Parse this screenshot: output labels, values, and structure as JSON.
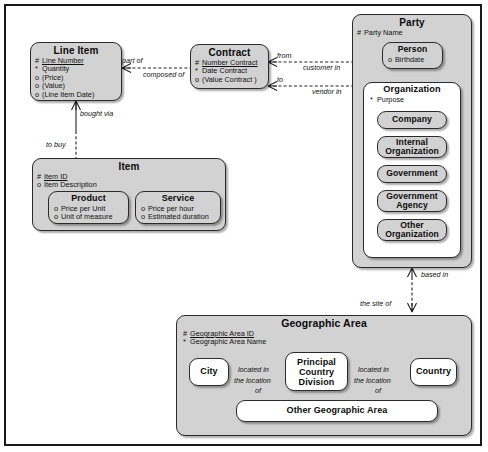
{
  "diagram": {
    "colors": {
      "entity_fill": "#d2d2d2",
      "leaf_fill": "#ffffff",
      "stroke": "#2b2b2b",
      "frame": "#1a1a1a"
    }
  },
  "entities": {
    "line_item": {
      "name": "Line Item",
      "attributes": [
        {
          "marker": "#",
          "label": "Line Number",
          "key": true
        },
        {
          "marker": "*",
          "label": "Quantity",
          "key": false
        },
        {
          "marker": "o",
          "label": "(Price)",
          "key": false
        },
        {
          "marker": "o",
          "label": "(Value)",
          "key": false
        },
        {
          "marker": "o",
          "label": "(Line Item Date)",
          "key": false
        }
      ]
    },
    "contract": {
      "name": "Contract",
      "attributes": [
        {
          "marker": "#",
          "label": "Number Contract",
          "key": true
        },
        {
          "marker": "*",
          "label": "Date Contract",
          "key": false
        },
        {
          "marker": "o",
          "label": "(Value Contract )",
          "key": false
        }
      ]
    },
    "party": {
      "name": "Party",
      "attributes": [
        {
          "marker": "#",
          "label": "Party Name",
          "key": false
        }
      ]
    },
    "person": {
      "name": "Person",
      "attributes": [
        {
          "marker": "o",
          "label": "Birthdate",
          "key": false
        }
      ]
    },
    "organization": {
      "name": "Organization",
      "attributes": [
        {
          "marker": "*",
          "label": "Purpose",
          "key": false
        }
      ],
      "subtypes": [
        {
          "name": "Company"
        },
        {
          "name": "Internal Organization"
        },
        {
          "name": "Government"
        },
        {
          "name": "Government Agency"
        },
        {
          "name": "Other Organization"
        }
      ]
    },
    "item": {
      "name": "Item",
      "attributes": [
        {
          "marker": "#",
          "label": "Item ID",
          "key": true
        },
        {
          "marker": "o",
          "label": "Item Description",
          "key": false
        }
      ]
    },
    "product": {
      "name": "Product",
      "attributes": [
        {
          "marker": "o",
          "label": "Price per Unit",
          "key": false
        },
        {
          "marker": "o",
          "label": "Unit of measure",
          "key": false
        }
      ]
    },
    "service": {
      "name": "Service",
      "attributes": [
        {
          "marker": "o",
          "label": "Price per hour",
          "key": false
        },
        {
          "marker": "o",
          "label": "Estimated duration",
          "key": false
        }
      ]
    },
    "geographic_area": {
      "name": "Geographic Area",
      "attributes": [
        {
          "marker": "#",
          "label": "Geographic Area ID",
          "key": true
        },
        {
          "marker": "*",
          "label": "Geographic Area Name",
          "key": false
        }
      ],
      "subtypes": [
        {
          "name": "City"
        },
        {
          "name": "Principal Country Division"
        },
        {
          "name": "Country"
        },
        {
          "name": "Other Geographic Area"
        }
      ]
    }
  },
  "relationships": [
    {
      "id": "line-item-contract",
      "from_label": "part of",
      "to_label": "composed of"
    },
    {
      "id": "contract-party-customer",
      "from_label": "from",
      "to_label": "customer in"
    },
    {
      "id": "contract-party-vendor",
      "from_label": "to",
      "to_label": "vendor in"
    },
    {
      "id": "line-item-item",
      "from_label": "bought via",
      "to_label": "to buy"
    },
    {
      "id": "party-geo",
      "from_label": "based in",
      "to_label": "the site of"
    },
    {
      "id": "city-pcd",
      "from_label": "located in",
      "to_label": "the location of"
    },
    {
      "id": "pcd-country",
      "from_label": "located in",
      "to_label": "the location of"
    }
  ],
  "edge_labels": {
    "part_of": "part of",
    "composed_of": "composed of",
    "from": "from",
    "customer_in": "customer in",
    "to": "to",
    "vendor_in": "vendor in",
    "bought_via": "bought via",
    "to_buy": "to buy",
    "based_in": "based in",
    "the_site_of": "the site of",
    "located_in_1": "located in",
    "the_location_of_1a": "the location",
    "the_location_of_1b": "of",
    "located_in_2": "located in",
    "the_location_of_2a": "the location",
    "the_location_of_2b": "of"
  }
}
